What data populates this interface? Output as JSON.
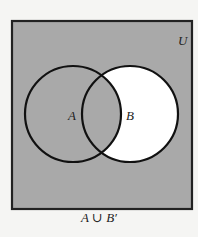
{
  "diagram": {
    "type": "venn",
    "universe_label": "U",
    "set_a_label": "A",
    "set_b_label": "B",
    "caption": "A ∪ B′",
    "colors": {
      "shaded": "#a9a9a9",
      "unshaded": "#ffffff",
      "stroke": "#111111",
      "background": "#f5f5f3"
    },
    "shaded_regions": [
      "A only",
      "A ∩ B",
      "outside A and B"
    ],
    "unshaded_regions": [
      "B only"
    ]
  }
}
